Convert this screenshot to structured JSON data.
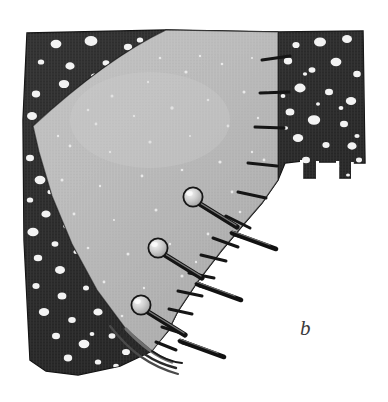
{
  "figure": {
    "label": "b",
    "caption_letter": "b",
    "width": 388,
    "height": 402,
    "background_color": "#ffffff"
  },
  "materials": {
    "dark_fabric": {
      "name": "polka-dot-fabric",
      "base_color": "#2e2e2e",
      "shadow_color": "#1a1a1a",
      "highlight_color": "#4a4a4a",
      "dot_color": "#f2f2f2",
      "dot_count": 96,
      "description": "dark polka dot fabric piece"
    },
    "light_fabric": {
      "name": "light-gray-fabric",
      "base_color": "#b9b9b9",
      "shade_color": "#a3a3a3",
      "highlight_color": "#cfcfcf",
      "speck_color": "#ececec",
      "speck_count": 70,
      "description": "light gray curved fabric panel"
    },
    "pin": {
      "name": "straight-pin",
      "head_fill": "#c9c9c9",
      "head_highlight": "#f0f0f0",
      "head_outline": "#1e1e1e",
      "shaft_color": "#1c1c1c",
      "shaft_highlight": "#8a8a8a",
      "count": 3
    },
    "seam_line": {
      "name": "stitched-seam",
      "color": "#191919"
    },
    "clip_notch": {
      "name": "clipped-notch",
      "color": "#141414",
      "count": 14,
      "description": "clips cut into the curved seam allowance"
    }
  },
  "geometry": {
    "dark_fabric_outline": "M 27 33 L 166 30 L 278 32 L 363 31 L 365 163 L 352 163 L 351 178 L 338 178 L 337 162 L 318 162 L 317 178 L 303 178 L 302 161 L 285 163 L 278 180 L 262 203 L 243 225 L 222 250 L 198 281 L 178 311 L 168 331 L 150 352 L 120 366 L 78 375 L 46 371 L 30 360 L 24 240 L 23 120 Z",
    "light_fabric_outline": "M 278 32 L 166 30 L 120 54 L 80 84 L 50 108 L 33 126 L 39 152 L 52 196 L 72 244 L 97 290 L 126 329 L 152 351 L 168 331 L 178 311 L 198 281 L 222 250 L 243 225 L 262 203 L 278 180 Z",
    "seam_curve": "M 166 30 C 120 52 70 92 33 126",
    "inner_curve": "M 276 36 C 274 110 250 180 200 260 C 180 295 166 325 152 351",
    "pins": [
      {
        "id": "pin-1",
        "head_cx": 193,
        "head_cy": 197,
        "head_r": 9.5,
        "tip_x": 277,
        "tip_y": 248
      },
      {
        "id": "pin-2",
        "head_cx": 158,
        "head_cy": 248,
        "head_r": 9.5,
        "tip_x": 242,
        "tip_y": 299
      },
      {
        "id": "pin-3",
        "head_cx": 141,
        "head_cy": 305,
        "head_r": 9.5,
        "tip_x": 225,
        "tip_y": 356
      }
    ]
  }
}
